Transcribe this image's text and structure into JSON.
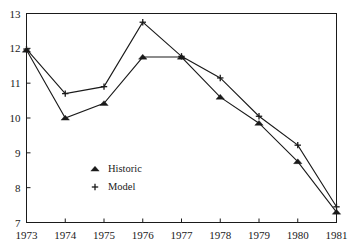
{
  "chart_data": {
    "type": "line",
    "title": "",
    "subtitle": "",
    "xlabel": "",
    "ylabel": "",
    "x": [
      1973,
      1974,
      1975,
      1976,
      1977,
      1978,
      1979,
      1980,
      1981
    ],
    "xtick_labels": [
      "1973",
      "1974",
      "1975",
      "1976",
      "1977",
      "1978",
      "1979",
      "1980",
      "1981"
    ],
    "ytick_labels": [
      "7",
      "8",
      "9",
      "10",
      "11",
      "12",
      "13"
    ],
    "yticks": [
      7,
      8,
      9,
      10,
      11,
      12,
      13
    ],
    "xlim": [
      1973,
      1981
    ],
    "ylim": [
      7,
      13
    ],
    "grid": false,
    "legend_position": "inside-lower-left",
    "series": [
      {
        "name": "Historic",
        "marker": "triangle",
        "values": [
          11.95,
          10.0,
          10.42,
          11.75,
          11.75,
          10.6,
          9.85,
          8.75,
          7.3
        ]
      },
      {
        "name": "Model",
        "marker": "plus",
        "values": [
          11.98,
          10.7,
          10.9,
          12.75,
          11.77,
          11.15,
          10.05,
          9.22,
          7.45
        ]
      }
    ],
    "legend": [
      {
        "label": "Historic",
        "marker": "triangle-marker"
      },
      {
        "label": "Model",
        "marker": "plus-marker"
      }
    ],
    "colors": {
      "line": "#1a1a1a",
      "axis": "#1a1a1a",
      "background": "#ffffff"
    }
  }
}
